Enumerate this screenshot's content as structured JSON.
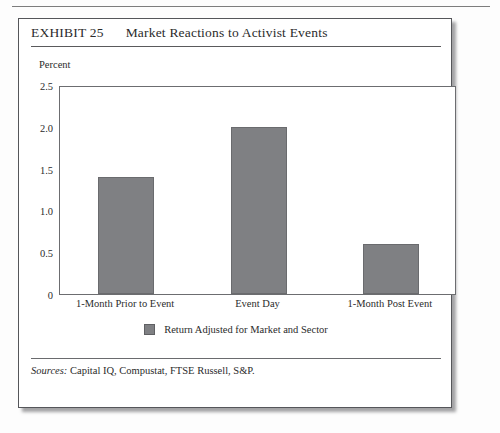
{
  "exhibit": {
    "number": "EXHIBIT 25",
    "title": "Market Reactions to Activist Events",
    "source_label": "Sources:",
    "source_text": " Capital IQ, Compustat, FTSE Russell, S&P."
  },
  "colors": {
    "bar_fill": "#7f8083",
    "bar_stroke": "#6a6b6e",
    "frame": "#55565a",
    "rule": "#5a5a5c",
    "text": "#2b2b2b"
  },
  "chart_data": {
    "type": "bar",
    "title": "Market Reactions to Activist Events",
    "xlabel": "",
    "ylabel": "Percent",
    "categories": [
      "1-Month Prior to Event",
      "Event Day",
      "1-Month Post Event"
    ],
    "values": [
      1.4,
      2.0,
      0.6
    ],
    "series": [
      {
        "name": "Return Adjusted for Market and Sector",
        "values": [
          1.4,
          2.0,
          0.6
        ]
      }
    ],
    "ylim": [
      0,
      2.5
    ],
    "yticks": [
      0,
      0.5,
      1.0,
      1.5,
      2.0,
      2.5
    ],
    "ytick_labels": [
      "0",
      "0.5",
      "1.0",
      "1.5",
      "2.0",
      "2.5"
    ],
    "grid": false,
    "legend": [
      "Return Adjusted for Market and Sector"
    ],
    "legend_position": "bottom-center"
  }
}
